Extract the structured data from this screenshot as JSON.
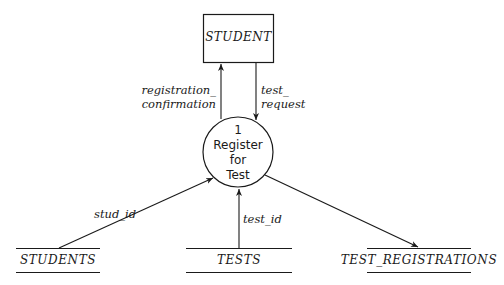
{
  "diagram": {
    "type": "data-flow-diagram",
    "external_entity": {
      "label": "STUDENT"
    },
    "process": {
      "number": "1",
      "line1": "Register",
      "line2": "for",
      "line3": "Test"
    },
    "data_stores": [
      {
        "label": "STUDENTS"
      },
      {
        "label": "TESTS"
      },
      {
        "label": "TEST_REGISTRATIONS"
      }
    ],
    "flows": [
      {
        "label_line1": "registration_",
        "label_line2": "confirmation",
        "from": "1",
        "to": "STUDENT"
      },
      {
        "label_line1": "test_",
        "label_line2": "request",
        "from": "STUDENT",
        "to": "1"
      },
      {
        "label": "stud_id",
        "from": "STUDENTS",
        "to": "1"
      },
      {
        "label": "test_id",
        "from": "TESTS",
        "to": "1"
      },
      {
        "label": "",
        "from": "1",
        "to": "TEST_REGISTRATIONS"
      }
    ],
    "colors": {
      "stroke": "#1a1a1a",
      "background": "#ffffff"
    }
  }
}
